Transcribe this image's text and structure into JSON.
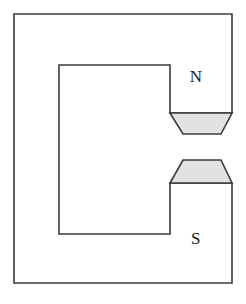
{
  "figure": {
    "background_color": "#ffffff",
    "stroke_color": "#3b3b3b",
    "pole_fill_color": "#e2e2e2",
    "core_fill_color": "#ffffff",
    "stroke_width": 1.6,
    "canvas": {
      "width": 246,
      "height": 304
    }
  },
  "labels": {
    "north": "N",
    "south": "S"
  },
  "geometry": {
    "outer_frame": {
      "left": 14,
      "top": 14,
      "right": 232,
      "bottom": 283
    },
    "inner_window": {
      "left": 59,
      "top": 65,
      "right": 170,
      "bottom": 234
    },
    "north_pole_piece": {
      "top_y": 113,
      "bottom_y": 134,
      "top_left_x": 170,
      "top_right_x": 232,
      "bottom_left_x": 183,
      "bottom_right_x": 221
    },
    "south_pole_piece": {
      "top_y": 160,
      "bottom_y": 183,
      "top_left_x": 183,
      "top_right_x": 221,
      "bottom_left_x": 170,
      "bottom_right_x": 232
    },
    "air_gap": {
      "top_y": 134,
      "bottom_y": 160
    },
    "label_positions": {
      "north": {
        "x": 196,
        "y": 78
      },
      "south": {
        "x": 196,
        "y": 240
      }
    }
  }
}
